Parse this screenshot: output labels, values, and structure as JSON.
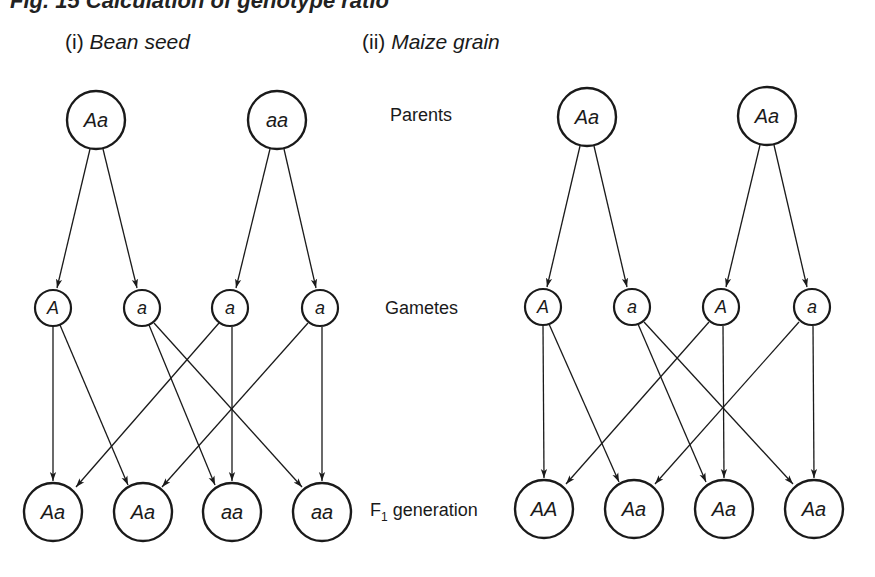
{
  "figure": {
    "title": "Fig. 15 Calculation of genotype ratio"
  },
  "row_labels": {
    "parents": "Parents",
    "gametes": "Gametes",
    "f1_prefix": "F",
    "f1_sub": "1",
    "f1_suffix": " generation"
  },
  "panels": [
    {
      "number": "(i)",
      "name": "Bean seed",
      "parents": [
        "Aa",
        "aa"
      ],
      "gametes": [
        "A",
        "a",
        "a",
        "a"
      ],
      "f1": [
        "Aa",
        "Aa",
        "aa",
        "aa"
      ]
    },
    {
      "number": "(ii)",
      "name": "Maize grain",
      "parents": [
        "Aa",
        "Aa"
      ],
      "gametes": [
        "A",
        "a",
        "A",
        "a"
      ],
      "f1": [
        "AA",
        "Aa",
        "Aa",
        "Aa"
      ]
    }
  ],
  "colors": {
    "stroke": "#1a1a1a",
    "background": "#ffffff"
  }
}
